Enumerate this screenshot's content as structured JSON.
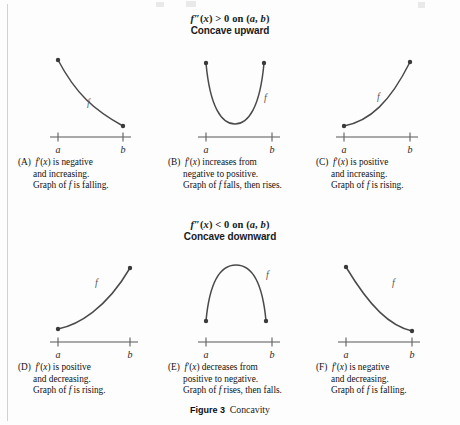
{
  "figure": {
    "caption_label": "Figure 3",
    "caption_text": "Concavity"
  },
  "sections": [
    {
      "id": "concave-upward",
      "condition": "f″(x) > 0 on (a, b)",
      "name": "Concave upward"
    },
    {
      "id": "concave-downward",
      "condition": "f″(x) < 0 on (a, b)",
      "name": "Concave downward"
    }
  ],
  "axis": {
    "left_tick_label": "a",
    "right_tick_label": "b"
  },
  "curve_label": "f",
  "panels": [
    {
      "id": "A",
      "letter": "(A)",
      "curve_shape": "decreasing-convex",
      "lines": [
        "f′(x) is negative",
        "and increasing.",
        "Graph of f is falling."
      ]
    },
    {
      "id": "B",
      "letter": "(B)",
      "curve_shape": "u-shape-convex",
      "lines": [
        "f′(x) increases from",
        "negative to positive.",
        "Graph of f falls, then rises."
      ]
    },
    {
      "id": "C",
      "letter": "(C)",
      "curve_shape": "increasing-convex",
      "lines": [
        "f′(x) is positive",
        "and increasing.",
        "Graph of f is rising."
      ]
    },
    {
      "id": "D",
      "letter": "(D)",
      "curve_shape": "increasing-concave",
      "lines": [
        "f′(x) is positive",
        "and decreasing.",
        "Graph of f is rising."
      ]
    },
    {
      "id": "E",
      "letter": "(E)",
      "curve_shape": "arch-concave",
      "lines": [
        "f′(x) decreases from",
        "positive to negative.",
        "Graph of f rises, then falls."
      ]
    },
    {
      "id": "F",
      "letter": "(F)",
      "curve_shape": "decreasing-concave",
      "lines": [
        "f′(x) is negative",
        "and decreasing.",
        "Graph of f is falling."
      ]
    }
  ],
  "colors": {
    "curve": "#4a4a4a",
    "axis": "#808080",
    "endpoint": "#3a3a3a",
    "text": "#1a1a1a",
    "background": "#fdfdfd"
  },
  "chart_data": {
    "type": "line",
    "title": "Concavity",
    "panels": [
      {
        "id": "A",
        "description": "Decreasing, concave upward curve from a to b",
        "x": [
          0,
          0.25,
          0.5,
          0.75,
          1
        ],
        "y": [
          1.0,
          0.66,
          0.41,
          0.24,
          0.15
        ],
        "xlabel": "",
        "ylabel": "",
        "xticks": [
          "a",
          "b"
        ]
      },
      {
        "id": "B",
        "description": "U-shaped parabola, concave upward, minimum inside (a, b)",
        "x": [
          0,
          0.25,
          0.5,
          0.75,
          1
        ],
        "y": [
          1.0,
          0.35,
          0.08,
          0.35,
          1.0
        ],
        "xlabel": "",
        "ylabel": "",
        "xticks": [
          "a",
          "b"
        ]
      },
      {
        "id": "C",
        "description": "Increasing, concave upward curve from a to b",
        "x": [
          0,
          0.25,
          0.5,
          0.75,
          1
        ],
        "y": [
          0.15,
          0.24,
          0.41,
          0.66,
          1.0
        ],
        "xlabel": "",
        "ylabel": "",
        "xticks": [
          "a",
          "b"
        ]
      },
      {
        "id": "D",
        "description": "Increasing, concave downward curve from a to b",
        "x": [
          0,
          0.25,
          0.5,
          0.75,
          1
        ],
        "y": [
          0.0,
          0.34,
          0.59,
          0.76,
          0.85
        ],
        "xlabel": "",
        "ylabel": "",
        "xticks": [
          "a",
          "b"
        ]
      },
      {
        "id": "E",
        "description": "Arch-shaped parabola, concave downward, maximum inside (a, b)",
        "x": [
          0,
          0.25,
          0.5,
          0.75,
          1
        ],
        "y": [
          0.0,
          0.65,
          0.92,
          0.65,
          0.0
        ],
        "xlabel": "",
        "ylabel": "",
        "xticks": [
          "a",
          "b"
        ]
      },
      {
        "id": "F",
        "description": "Decreasing, concave downward curve from a to b",
        "x": [
          0,
          0.25,
          0.5,
          0.75,
          1
        ],
        "y": [
          0.85,
          0.76,
          0.59,
          0.34,
          0.0
        ],
        "xlabel": "",
        "ylabel": "",
        "xticks": [
          "a",
          "b"
        ]
      }
    ],
    "grid": false,
    "legend": "none"
  }
}
